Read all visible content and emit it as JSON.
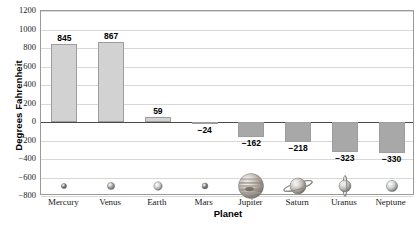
{
  "chart_data": {
    "type": "bar",
    "title": "Average Surface Temperature of the Planets",
    "xlabel": "Planet",
    "ylabel": "Degrees Fahrenheit",
    "categories": [
      "Mercury",
      "Venus",
      "Earth",
      "Mars",
      "Jupiter",
      "Saturn",
      "Uranus",
      "Neptune"
    ],
    "values": [
      845,
      867,
      59,
      -24,
      -162,
      -218,
      -323,
      -330
    ],
    "value_labels": [
      "845",
      "867",
      "59",
      "−24",
      "−162",
      "−218",
      "−323",
      "−330"
    ],
    "ylim": [
      -800,
      1200
    ],
    "ytick_values": [
      1200,
      1000,
      800,
      600,
      400,
      200,
      0,
      -200,
      -400,
      -600,
      -800
    ],
    "ytick_labels": [
      "1200",
      "1000",
      "800",
      "600",
      "400",
      "200",
      "0",
      "−200",
      "−400",
      "−600",
      "−800"
    ],
    "grid": true,
    "legend": "none",
    "series_name": "Average Surface Temperature",
    "colors": {
      "positive_bar": "#d2d2d2",
      "negative_bar": "#a8a8a8",
      "bar_border": "#9d9d9d",
      "gridline": "#d8d8d8",
      "zero_line": "#4a4a4a",
      "frame": "#9a9a9a",
      "text": "#1a1a1a",
      "background": "#ffffff"
    },
    "planet_icons": [
      {
        "name": "mercury-planet-icon",
        "radius": 2.6,
        "fill": "#6d6a66",
        "has_rings": false
      },
      {
        "name": "venus-planet-icon",
        "radius": 3.6,
        "fill": "#9c9892",
        "has_rings": false
      },
      {
        "name": "earth-planet-icon",
        "radius": 4.2,
        "fill": "#c3c7cb",
        "has_rings": false
      },
      {
        "name": "mars-planet-icon",
        "radius": 2.9,
        "fill": "#6f6b67",
        "has_rings": false
      },
      {
        "name": "jupiter-planet-icon",
        "radius": 12.5,
        "fill": "#b7b0a7",
        "has_rings": false
      },
      {
        "name": "saturn-planet-icon",
        "radius": 8.0,
        "fill": "#bcb6ad",
        "has_rings": true
      },
      {
        "name": "uranus-planet-icon",
        "radius": 6.0,
        "fill": "#b6bcbc",
        "has_rings": true
      },
      {
        "name": "neptune-planet-icon",
        "radius": 5.6,
        "fill": "#c2c6ca",
        "has_rings": false
      }
    ]
  }
}
